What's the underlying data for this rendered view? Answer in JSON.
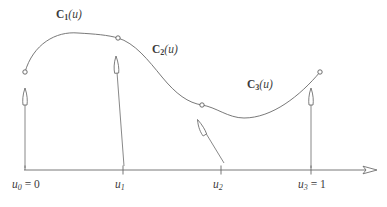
{
  "figure": {
    "background_color": "#ffffff",
    "stroke_color": "#6a6a6a",
    "text_color": "#3b3b3b",
    "curve_labels": [
      {
        "id": "c1",
        "base": "C",
        "subscript": "1",
        "argument": "(u)",
        "text": "C1(u)",
        "x": 56,
        "y": 9
      },
      {
        "id": "c2",
        "base": "C",
        "subscript": "2",
        "argument": "(u)",
        "text": "C2(u)",
        "x": 152,
        "y": 44
      },
      {
        "id": "c3",
        "base": "C",
        "subscript": "3",
        "argument": "(u)",
        "text": "C3(u)",
        "x": 247,
        "y": 79
      }
    ],
    "axis": {
      "y": 170,
      "x_start": 24,
      "x_end": 363,
      "arrow_tip_x": 377,
      "ticks": [
        {
          "id": "u0",
          "x": 25,
          "base": "u",
          "subscript": "0",
          "equals": " = 0",
          "text": "u0 = 0",
          "label_x": 12,
          "label_y": 179
        },
        {
          "id": "u1",
          "x": 123,
          "base": "u",
          "subscript": "1",
          "equals": "",
          "text": "u1",
          "label_x": 115,
          "label_y": 179
        },
        {
          "id": "u2",
          "x": 221,
          "base": "u",
          "subscript": "2",
          "equals": "",
          "text": "u2",
          "label_x": 213,
          "label_y": 179
        },
        {
          "id": "u3",
          "x": 311,
          "base": "u",
          "subscript": "3",
          "equals": " = 1",
          "text": "u3 = 1",
          "label_x": 298,
          "label_y": 179
        }
      ]
    },
    "knots": [
      {
        "id": "knot-u0",
        "x": 25,
        "y": 72,
        "r": 2.2
      },
      {
        "id": "knot-u1",
        "x": 118,
        "y": 38,
        "r": 2.2
      },
      {
        "id": "knot-u2",
        "x": 202,
        "y": 105,
        "r": 2.2
      },
      {
        "id": "knot-u3",
        "x": 320,
        "y": 72,
        "r": 2.2
      }
    ],
    "segments": [
      {
        "id": "segment-c1",
        "path": "M 25 72 C 33 44 56 31 78 33 C 95 34 108 35 118 38"
      },
      {
        "id": "segment-c2",
        "path": "M 118 38 C 135 43 148 60 162 77 C 176 94 188 103 202 105"
      },
      {
        "id": "segment-c3",
        "path": "M 202 105 C 216 107 228 118 244 118 C 272 118 300 96 320 72"
      }
    ],
    "tangent_vectors": [
      {
        "id": "tangent-u0",
        "x1": 25,
        "y1": 168,
        "x2": 25,
        "y2": 97,
        "orientation": "vertical"
      },
      {
        "id": "tangent-u1",
        "x1": 124,
        "y1": 166,
        "x2": 116,
        "y2": 64,
        "orientation": "near-vertical"
      },
      {
        "id": "tangent-u2",
        "x1": 224,
        "y1": 163,
        "x2": 200,
        "y2": 124,
        "orientation": "diagonal"
      },
      {
        "id": "tangent-u3",
        "x1": 311,
        "y1": 168,
        "x2": 311,
        "y2": 97,
        "orientation": "vertical"
      }
    ]
  }
}
